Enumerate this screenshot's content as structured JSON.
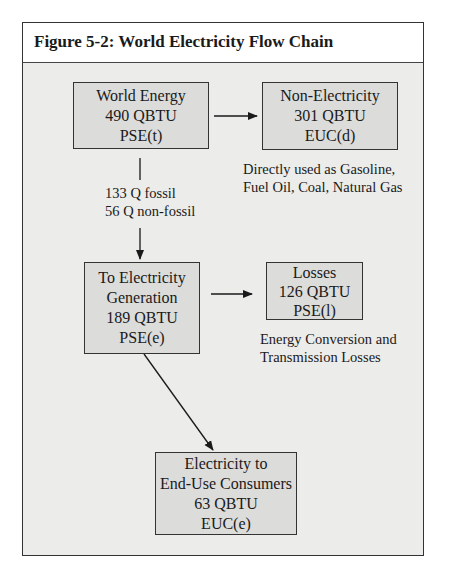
{
  "figure": {
    "title": "Figure 5-2:  World Electricity Flow Chain"
  },
  "nodes": {
    "world_energy": {
      "line1": "World Energy",
      "line2": "490 QBTU",
      "line3": "PSE(t)"
    },
    "non_electricity": {
      "line1": "Non-Electricity",
      "line2": "301 QBTU",
      "line3": "EUC(d)"
    },
    "to_electricity": {
      "line1": "To Electricity",
      "line2": "Generation",
      "line3": "189 QBTU",
      "line4": "PSE(e)"
    },
    "losses": {
      "line1": "Losses",
      "line2": "126 QBTU",
      "line3": "PSE(l)"
    },
    "end_use": {
      "line1": "Electricity to",
      "line2": "End-Use Consumers",
      "line3": "63 QBTU",
      "line4": "EUC(e)"
    }
  },
  "notes": {
    "non_electricity": {
      "line1": "Directly used as Gasoline,",
      "line2": "Fuel Oil, Coal, Natural Gas"
    },
    "world_to_elec": {
      "line1": "133 Q fossil",
      "line2": "56 Q non-fossil"
    },
    "losses": {
      "line1": "Energy Conversion and",
      "line2": "Transmission Losses"
    }
  },
  "edges": [
    {
      "from": "World Energy",
      "to": "Non-Electricity",
      "value": "301 QBTU"
    },
    {
      "from": "World Energy",
      "to": "To Electricity Generation",
      "value": "189 QBTU",
      "label": "133 Q fossil / 56 Q non-fossil"
    },
    {
      "from": "To Electricity Generation",
      "to": "Losses",
      "value": "126 QBTU"
    },
    {
      "from": "To Electricity Generation",
      "to": "Electricity to End-Use Consumers",
      "value": "63 QBTU"
    }
  ],
  "colors": {
    "frame_bg": "#ececea",
    "box_bg": "#dcdcda",
    "line": "#1a1a1a"
  }
}
